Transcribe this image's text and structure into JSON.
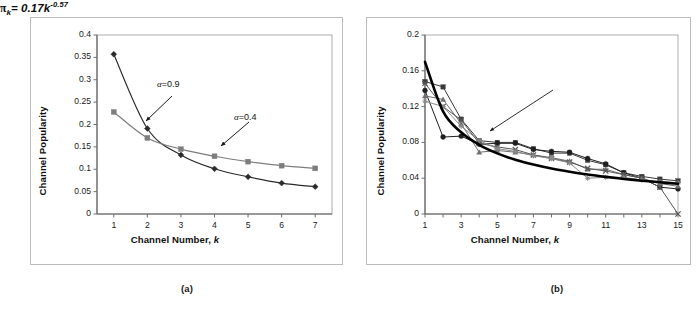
{
  "figure": {
    "panel_a_caption": "(a)",
    "panel_b_caption": "(b)"
  },
  "panel_a": {
    "ylabel": "Channel Popularity",
    "xlabel_text": "Channel Number, ",
    "xlabel_italic": "k",
    "y_ticks": [
      "0",
      "0.05",
      "0.1",
      "0.15",
      "0.2",
      "0.25",
      "0.3",
      "0.35",
      "0.4"
    ],
    "x_ticks": [
      "1",
      "2",
      "3",
      "4",
      "5",
      "6",
      "7"
    ],
    "annotations": [
      {
        "name": "alpha-09",
        "symbol": "α",
        "text": "=0.9"
      },
      {
        "name": "alpha-04",
        "symbol": "α",
        "text": "=0.4"
      }
    ]
  },
  "panel_b": {
    "ylabel": "Channel Popularity",
    "xlabel_text": "Channel Number, ",
    "xlabel_italic": "k",
    "y_ticks": [
      "0",
      "0.04",
      "0.08",
      "0.12",
      "0.16",
      "0.2"
    ],
    "x_ticks": [
      "1",
      "3",
      "5",
      "7",
      "9",
      "11",
      "13",
      "15"
    ],
    "equation": {
      "pi": "π",
      "sub": "k",
      "mid": "= 0.17k",
      "exp": "-0.57"
    }
  },
  "chart_data": [
    {
      "id": "panel_a",
      "type": "line",
      "title": "",
      "subtitle": "(a)",
      "xlabel": "Channel Number, k",
      "ylabel": "Channel Popularity",
      "xlim": [
        0.5,
        7.5
      ],
      "ylim": [
        0,
        0.4
      ],
      "x_tick_values": [
        1,
        2,
        3,
        4,
        5,
        6,
        7
      ],
      "y_tick_values": [
        0,
        0.05,
        0.1,
        0.15,
        0.2,
        0.25,
        0.3,
        0.35,
        0.4
      ],
      "grid": false,
      "legend": "annotated-inline",
      "x": [
        1,
        2,
        3,
        4,
        5,
        6,
        7
      ],
      "series": [
        {
          "name": "α=0.9",
          "marker": "diamond",
          "color": "#2a2a2a",
          "values": [
            0.357,
            0.191,
            0.132,
            0.101,
            0.083,
            0.069,
            0.061
          ]
        },
        {
          "name": "α=0.4",
          "marker": "square",
          "color": "#7d7d7d",
          "values": [
            0.228,
            0.17,
            0.145,
            0.129,
            0.117,
            0.108,
            0.102
          ]
        }
      ],
      "annotations": [
        {
          "text": "α=0.9",
          "points_to_series": "α=0.9",
          "points_to_x": 2
        },
        {
          "text": "α=0.4",
          "points_to_series": "α=0.4",
          "points_to_x": 4
        }
      ]
    },
    {
      "id": "panel_b",
      "type": "line",
      "title": "",
      "subtitle": "(b)",
      "xlabel": "Channel Number, k",
      "ylabel": "Channel Popularity",
      "xlim": [
        1,
        15
      ],
      "ylim": [
        0,
        0.2
      ],
      "x_tick_values": [
        1,
        3,
        5,
        7,
        9,
        11,
        13,
        15
      ],
      "y_tick_values": [
        0,
        0.04,
        0.08,
        0.12,
        0.16,
        0.2
      ],
      "grid": false,
      "legend": "none",
      "x": [
        1,
        2,
        3,
        4,
        5,
        6,
        7,
        8,
        9,
        10,
        11,
        12,
        13,
        14,
        15
      ],
      "series": [
        {
          "name": "trace-1",
          "marker": "square",
          "color": "#3a3a3a",
          "values": [
            0.148,
            0.142,
            0.106,
            0.082,
            0.08,
            0.08,
            0.073,
            0.068,
            0.068,
            0.06,
            0.055,
            0.046,
            0.042,
            0.039,
            0.037
          ]
        },
        {
          "name": "trace-2",
          "marker": "circle",
          "color": "#1f1f1f",
          "values": [
            0.138,
            0.086,
            0.087,
            0.078,
            0.079,
            0.079,
            0.072,
            0.07,
            0.069,
            0.062,
            0.056,
            0.046,
            0.04,
            0.03,
            0.028
          ]
        },
        {
          "name": "trace-3",
          "marker": "triangle",
          "color": "#6f6f6f",
          "values": [
            0.132,
            0.128,
            0.101,
            0.069,
            0.071,
            0.069,
            0.066,
            0.063,
            0.059,
            0.05,
            0.05,
            0.044,
            0.04,
            0.034,
            0.031
          ]
        },
        {
          "name": "trace-4",
          "marker": "cross",
          "color": "#555555",
          "values": [
            0.146,
            0.12,
            0.105,
            0.079,
            0.075,
            0.072,
            0.066,
            0.062,
            0.058,
            0.051,
            0.048,
            0.044,
            0.04,
            0.03,
            0.0
          ]
        },
        {
          "name": "trace-5",
          "marker": "star",
          "color": "#8a8a8a",
          "values": [
            0.126,
            0.12,
            0.098,
            0.082,
            0.073,
            0.07,
            0.065,
            0.062,
            0.057,
            0.04,
            0.041,
            0.041,
            0.038,
            0.036,
            0.035
          ]
        },
        {
          "name": "π_k = 0.17k^-0.57",
          "marker": "none",
          "color": "#000000",
          "fit": true,
          "formula": "0.17 * k^(-0.57)",
          "values": [
            0.17,
            0.1146,
            0.0913,
            0.0773,
            0.0677,
            0.0606,
            0.0552,
            0.0508,
            0.0472,
            0.0441,
            0.0415,
            0.0392,
            0.0372,
            0.0354,
            0.0338
          ]
        }
      ],
      "annotations": [
        {
          "text": "πk = 0.17k^-0.57",
          "points_to_series": "fit",
          "points_to_x": 5
        }
      ]
    }
  ]
}
